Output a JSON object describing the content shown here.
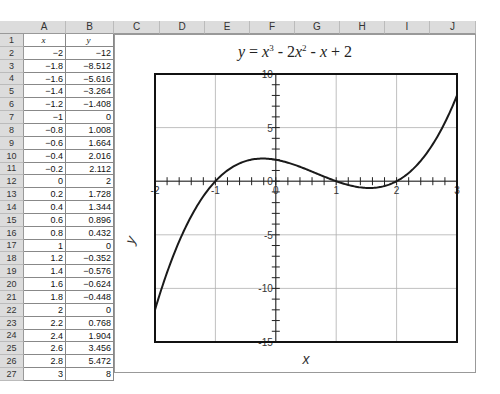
{
  "spreadsheet": {
    "columns": [
      "A",
      "B",
      "C",
      "D",
      "E",
      "F",
      "G",
      "H",
      "I",
      "J"
    ],
    "header_row": {
      "A": "x",
      "B": "y"
    },
    "rows": [
      {
        "row": 1,
        "x": "x",
        "y": "y"
      },
      {
        "row": 2,
        "x": "-2",
        "y": "-12"
      },
      {
        "row": 3,
        "x": "-1.8",
        "y": "-8.512"
      },
      {
        "row": 4,
        "x": "-1.6",
        "y": "-5.616"
      },
      {
        "row": 5,
        "x": "-1.4",
        "y": "-3.264"
      },
      {
        "row": 6,
        "x": "-1.2",
        "y": "-1.408"
      },
      {
        "row": 7,
        "x": "-1",
        "y": "0"
      },
      {
        "row": 8,
        "x": "-0.8",
        "y": "1.008"
      },
      {
        "row": 9,
        "x": "-0.6",
        "y": "1.664"
      },
      {
        "row": 10,
        "x": "-0.4",
        "y": "2.016"
      },
      {
        "row": 11,
        "x": "-0.2",
        "y": "2.112"
      },
      {
        "row": 12,
        "x": "0",
        "y": "2"
      },
      {
        "row": 13,
        "x": "0.2",
        "y": "1.728"
      },
      {
        "row": 14,
        "x": "0.4",
        "y": "1.344"
      },
      {
        "row": 15,
        "x": "0.6",
        "y": "0.896"
      },
      {
        "row": 16,
        "x": "0.8",
        "y": "0.432"
      },
      {
        "row": 17,
        "x": "1",
        "y": "0"
      },
      {
        "row": 18,
        "x": "1.2",
        "y": "-0.352"
      },
      {
        "row": 19,
        "x": "1.4",
        "y": "-0.576"
      },
      {
        "row": 20,
        "x": "1.6",
        "y": "-0.624"
      },
      {
        "row": 21,
        "x": "1.8",
        "y": "-0.448"
      },
      {
        "row": 22,
        "x": "2",
        "y": "0"
      },
      {
        "row": 23,
        "x": "2.2",
        "y": "0.768"
      },
      {
        "row": 24,
        "x": "2.4",
        "y": "1.904"
      },
      {
        "row": 25,
        "x": "2.6",
        "y": "3.456"
      },
      {
        "row": 26,
        "x": "2.8",
        "y": "5.472"
      },
      {
        "row": 27,
        "x": "3",
        "y": "8"
      }
    ]
  },
  "chart": {
    "title_parts": {
      "y": "y",
      "eq": " = ",
      "x1": "x",
      "p1": "3",
      "m1": " - 2",
      "x2": "x",
      "p2": "2",
      "m2": " - ",
      "x3": "x",
      "end": " + 2"
    },
    "xlabel": "x",
    "ylabel": "y",
    "x_ticks": [
      "-2",
      "-1",
      "0",
      "1",
      "2",
      "3"
    ],
    "y_ticks": [
      "10",
      "5",
      "0",
      "-5",
      "-10",
      "-15"
    ],
    "line_color": "#1a1a1a",
    "grid_color": "#b0b0b0"
  },
  "chart_data": {
    "type": "line",
    "xlabel": "x",
    "ylabel": "y",
    "xlim": [
      -2,
      3
    ],
    "ylim": [
      -15,
      10
    ],
    "grid": true,
    "x": [
      -2,
      -1.8,
      -1.6,
      -1.4,
      -1.2,
      -1,
      -0.8,
      -0.6,
      -0.4,
      -0.2,
      0,
      0.2,
      0.4,
      0.6,
      0.8,
      1,
      1.2,
      1.4,
      1.6,
      1.8,
      2,
      2.2,
      2.4,
      2.6,
      2.8,
      3
    ],
    "series": [
      {
        "name": "y",
        "values": [
          -12,
          -8.512,
          -5.616,
          -3.264,
          -1.408,
          0,
          1.008,
          1.664,
          2.016,
          2.112,
          2,
          1.728,
          1.344,
          0.896,
          0.432,
          0,
          -0.352,
          -0.576,
          -0.624,
          -0.448,
          0,
          0.768,
          1.904,
          3.456,
          5.472,
          8
        ]
      }
    ]
  }
}
